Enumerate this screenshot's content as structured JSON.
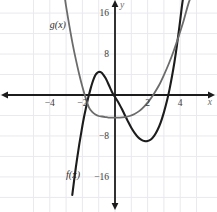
{
  "chart_data": {
    "type": "line",
    "title": "",
    "xlabel": "x",
    "ylabel": "y",
    "grid": true,
    "legend_position": "inline-curve-labels",
    "xlim": [
      -5.2,
      5.3
    ],
    "ylim": [
      -19.5,
      19.5
    ],
    "x_ticks": [
      -4,
      -2,
      2,
      4
    ],
    "x_tick_labels": [
      "−4",
      "−2",
      "2",
      "4"
    ],
    "y_ticks": [
      16,
      8,
      -8,
      -16
    ],
    "y_tick_labels": [
      "16",
      "8",
      "−8",
      "−16"
    ],
    "grid_step_x": 1,
    "grid_step_y": 4,
    "series": [
      {
        "name": "f(x)",
        "label": "f(x)",
        "color": "#1c1c1c",
        "width": 2.1,
        "kind": "cubic",
        "description": "cubic with roots near -2, 0 and 3; local max about 4.2 at x=-1.2; local min about -9 at x=2.3",
        "roots": [
          -2,
          0,
          3
        ],
        "local_max": {
          "x": -1.2,
          "y": 4.2
        },
        "local_min": {
          "x": 2.3,
          "y": -9.0
        },
        "points": [
          [
            -2.62,
            -19.5
          ],
          [
            -2.5,
            -16.5
          ],
          [
            -2.4,
            -14.1
          ],
          [
            -2.3,
            -11.9
          ],
          [
            -2.2,
            -9.8
          ],
          [
            -2.1,
            -7.9
          ],
          [
            -2.0,
            -6.0
          ],
          [
            -1.9,
            -4.3
          ],
          [
            -1.8,
            -2.8
          ],
          [
            -1.7,
            -1.3
          ],
          [
            -1.6,
            0.0
          ],
          [
            -1.5,
            1.2
          ],
          [
            -1.4,
            2.3
          ],
          [
            -1.3,
            3.2
          ],
          [
            -1.2,
            3.9
          ],
          [
            -1.1,
            4.3
          ],
          [
            -1.0,
            4.5
          ],
          [
            -0.9,
            4.5
          ],
          [
            -0.8,
            4.3
          ],
          [
            -0.7,
            3.9
          ],
          [
            -0.6,
            3.4
          ],
          [
            -0.5,
            2.8
          ],
          [
            -0.4,
            2.1
          ],
          [
            -0.3,
            1.4
          ],
          [
            -0.2,
            0.7
          ],
          [
            -0.1,
            0.1
          ],
          [
            0.0,
            -0.4
          ],
          [
            0.2,
            -1.4
          ],
          [
            0.4,
            -2.6
          ],
          [
            0.6,
            -3.9
          ],
          [
            0.8,
            -5.2
          ],
          [
            1.0,
            -6.4
          ],
          [
            1.2,
            -7.4
          ],
          [
            1.4,
            -8.2
          ],
          [
            1.6,
            -8.7
          ],
          [
            1.8,
            -9.0
          ],
          [
            2.0,
            -9.0
          ],
          [
            2.2,
            -8.7
          ],
          [
            2.4,
            -8.0
          ],
          [
            2.6,
            -6.9
          ],
          [
            2.8,
            -5.4
          ],
          [
            3.0,
            -3.4
          ],
          [
            3.2,
            -1.0
          ],
          [
            3.35,
            1.2
          ],
          [
            3.5,
            3.7
          ],
          [
            3.65,
            6.5
          ],
          [
            3.8,
            9.7
          ],
          [
            3.95,
            13.3
          ],
          [
            4.1,
            17.2
          ],
          [
            4.2,
            19.5
          ]
        ]
      },
      {
        "name": "g(x)",
        "label": "g(x)",
        "color": "#6b6b6b",
        "width": 1.8,
        "kind": "parabola",
        "description": "upward parabola, vertex about (0.3, -4.2), roots near -2 and 3",
        "vertex": {
          "x": 0.3,
          "y": -4.2
        },
        "roots": [
          -2,
          3
        ],
        "points": [
          [
            -3.1,
            19.5
          ],
          [
            -3.0,
            17.3
          ],
          [
            -2.8,
            13.5
          ],
          [
            -2.6,
            10.0
          ],
          [
            -2.4,
            6.9
          ],
          [
            -2.2,
            4.1
          ],
          [
            -2.0,
            1.6
          ],
          [
            -1.8,
            -0.6
          ],
          [
            -1.6,
            -2.4
          ],
          [
            -1.4,
            -3.3
          ],
          [
            -1.2,
            -3.8
          ],
          [
            -1.0,
            -4.1
          ],
          [
            -0.8,
            -4.2
          ],
          [
            -0.6,
            -4.3
          ],
          [
            -0.4,
            -4.4
          ],
          [
            -0.2,
            -4.4
          ],
          [
            0.0,
            -4.4
          ],
          [
            0.3,
            -4.4
          ],
          [
            0.6,
            -4.3
          ],
          [
            0.9,
            -4.1
          ],
          [
            1.2,
            -3.7
          ],
          [
            1.5,
            -3.1
          ],
          [
            1.8,
            -2.2
          ],
          [
            2.1,
            -1.1
          ],
          [
            2.4,
            0.3
          ],
          [
            2.7,
            1.9
          ],
          [
            3.0,
            3.9
          ],
          [
            3.3,
            6.1
          ],
          [
            3.6,
            8.6
          ],
          [
            3.9,
            11.4
          ],
          [
            4.2,
            14.4
          ],
          [
            4.5,
            17.8
          ],
          [
            4.7,
            19.5
          ]
        ]
      }
    ],
    "colors": {
      "background": "#ffffff",
      "grid": "#e9e9ee",
      "axis": "#1c1c1c",
      "tick_label": "#3a3a3a",
      "f_curve": "#1c1c1c",
      "g_curve": "#6b6b6b"
    },
    "annotations": [
      {
        "name": "f-curve-label",
        "text": "f(x)",
        "x": -3.0,
        "y": -16.2
      },
      {
        "name": "g-curve-label",
        "text": "g(x)",
        "x": -4.0,
        "y": 13.0
      }
    ]
  }
}
